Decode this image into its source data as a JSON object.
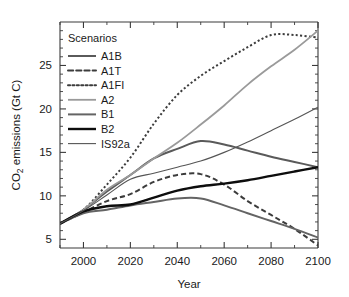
{
  "chart_data": {
    "type": "line",
    "title": "",
    "xlabel": "Year",
    "ylabel": "CO2 emissions (Gt C)",
    "ylabel_parts": {
      "pre": "CO",
      "sub": "2",
      "post": " emissions (Gt C)"
    },
    "xlim": [
      1990,
      2100
    ],
    "ylim": [
      4,
      30
    ],
    "grid": false,
    "legend_position": "top-left-inside",
    "legend_title": "Scenarios",
    "xticks": [
      2000,
      2020,
      2040,
      2060,
      2080,
      2100
    ],
    "xticklabels": [
      "2000",
      "2020",
      "2040",
      "2060",
      "2080",
      "2100"
    ],
    "xticks_minor": [
      1990,
      2010,
      2030,
      2050,
      2070,
      2090
    ],
    "yticks": [
      5,
      10,
      15,
      20,
      25
    ],
    "yticklabels": [
      "5",
      "10",
      "15",
      "20",
      "25"
    ],
    "yticks_minor": [
      6,
      7,
      8,
      9,
      11,
      12,
      13,
      14,
      16,
      17,
      18,
      19,
      21,
      22,
      23,
      24,
      26,
      27,
      28,
      29
    ],
    "x": [
      1990,
      2000,
      2010,
      2020,
      2030,
      2040,
      2050,
      2060,
      2070,
      2080,
      2090,
      2100
    ],
    "series": [
      {
        "name": "A1B",
        "style": "solid",
        "color": "#5a5a5a",
        "width": 2.0,
        "values": [
          6.8,
          8.4,
          10.5,
          12.4,
          14.3,
          15.4,
          16.3,
          15.9,
          15.2,
          14.5,
          13.9,
          13.3
        ]
      },
      {
        "name": "A1T",
        "style": "dashed",
        "color": "#3c3c3c",
        "width": 2.0,
        "values": [
          6.8,
          8.1,
          9.4,
          10.2,
          11.6,
          12.4,
          12.5,
          11.3,
          9.4,
          7.8,
          6.2,
          4.3
        ]
      },
      {
        "name": "A1FI",
        "style": "dotted",
        "color": "#3c3c3c",
        "width": 2.0,
        "values": [
          6.8,
          8.4,
          11.3,
          14.4,
          18.3,
          21.6,
          23.8,
          25.5,
          27.1,
          28.5,
          28.5,
          28.2
        ]
      },
      {
        "name": "A2",
        "style": "solid",
        "color": "#9a9a9a",
        "width": 1.8,
        "values": [
          6.8,
          8.4,
          10.7,
          12.4,
          14.3,
          16.1,
          18.2,
          20.4,
          22.8,
          24.9,
          26.8,
          29.0
        ]
      },
      {
        "name": "B1",
        "style": "solid",
        "color": "#646464",
        "width": 2.0,
        "values": [
          6.8,
          8.0,
          8.4,
          8.9,
          9.3,
          9.7,
          9.7,
          8.9,
          8.0,
          7.1,
          6.2,
          5.2
        ]
      },
      {
        "name": "B2",
        "style": "solid",
        "color": "#0d0d0d",
        "width": 2.4,
        "values": [
          6.8,
          8.2,
          8.8,
          9.0,
          9.8,
          10.6,
          11.1,
          11.4,
          11.8,
          12.3,
          12.8,
          13.3
        ]
      },
      {
        "name": "IS92a",
        "style": "solid",
        "color": "#555555",
        "width": 1.1,
        "values": [
          6.8,
          8.3,
          10.1,
          11.9,
          12.6,
          13.3,
          14.0,
          15.0,
          16.2,
          17.5,
          18.8,
          20.2
        ]
      }
    ]
  },
  "legend": {
    "title": "Scenarios",
    "entries": [
      {
        "label": "A1B"
      },
      {
        "label": "A1T"
      },
      {
        "label": "A1FI"
      },
      {
        "label": "A2"
      },
      {
        "label": "B1"
      },
      {
        "label": "B2"
      },
      {
        "label": "IS92a"
      }
    ]
  },
  "axes": {
    "x_title": "Year",
    "y_title_pre": "CO",
    "y_title_sub": "2",
    "y_title_post": " emissions (Gt C)"
  }
}
